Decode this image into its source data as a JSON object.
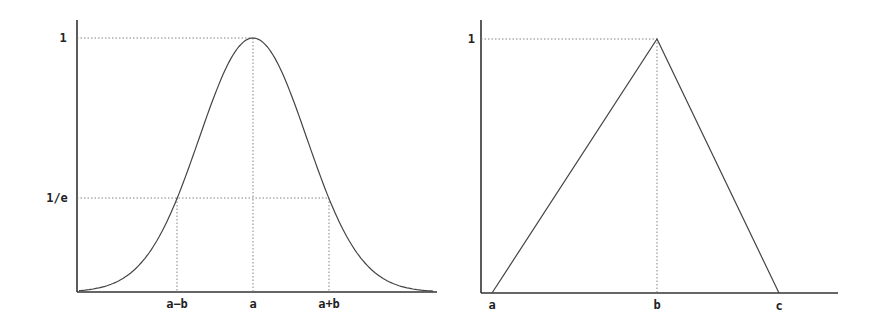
{
  "left_panel": {
    "title": "",
    "y_labels": {
      "one": "1",
      "inv_e": "1/e"
    },
    "x_labels": {
      "a_minus_b": "a−b",
      "a": "a",
      "a_plus_b": "a+b"
    }
  },
  "right_panel": {
    "title": "",
    "y_labels": {
      "one": "1"
    },
    "x_labels": {
      "a": "a",
      "b": "b",
      "c": "c"
    }
  },
  "chart_data": [
    {
      "type": "line",
      "title": "Gaussian membership function",
      "xlabel": "",
      "ylabel": "",
      "function": "exp(-((x-a)/b)^2)",
      "x_ticks": [
        "a−b",
        "a",
        "a+b"
      ],
      "y_ticks": [
        "1/e",
        "1"
      ],
      "x": [
        -3,
        -2.5,
        -2,
        -1.5,
        -1,
        -0.5,
        0,
        0.5,
        1,
        1.5,
        2,
        2.5,
        3
      ],
      "values": [
        0.0001,
        0.0019,
        0.0183,
        0.1054,
        0.3679,
        0.7788,
        1.0,
        0.7788,
        0.3679,
        0.1054,
        0.0183,
        0.0019,
        0.0001
      ],
      "x_units": "multiples of b from a",
      "ylim": [
        0,
        1
      ],
      "guides": [
        "horizontal dotted at 1",
        "horizontal dotted at 1/e",
        "vertical dotted at a-b, a, a+b"
      ],
      "grid": false
    },
    {
      "type": "line",
      "title": "Triangular membership function",
      "xlabel": "",
      "ylabel": "",
      "x_ticks": [
        "a",
        "b",
        "c"
      ],
      "y_ticks": [
        "1"
      ],
      "x": [
        "a",
        "b",
        "c"
      ],
      "values": [
        0,
        1,
        0
      ],
      "ylim": [
        0,
        1
      ],
      "guides": [
        "horizontal dotted at 1",
        "vertical dotted at b"
      ],
      "grid": false
    }
  ]
}
